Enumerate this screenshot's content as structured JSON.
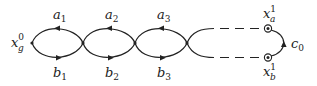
{
  "diagram": {
    "colors": {
      "stroke": "#222222",
      "background": "#ffffff"
    },
    "base_point": {
      "main": "x",
      "sub": "g",
      "sup": "0"
    },
    "loops": [
      {
        "top": {
          "main": "a",
          "sub": "1"
        },
        "bottom": {
          "main": "b",
          "sub": "1"
        }
      },
      {
        "top": {
          "main": "a",
          "sub": "2"
        },
        "bottom": {
          "main": "b",
          "sub": "2"
        }
      },
      {
        "top": {
          "main": "a",
          "sub": "3"
        },
        "bottom": {
          "main": "b",
          "sub": "3"
        }
      }
    ],
    "endpoint_top": {
      "main": "x",
      "sub": "a",
      "sup": "1"
    },
    "endpoint_bottom": {
      "main": "x",
      "sub": "b",
      "sup": "1"
    },
    "connector": {
      "main": "c",
      "sub": "0"
    },
    "arrow_directions": {
      "top_edges": "left",
      "bottom_edges": "right",
      "connector": "up"
    }
  }
}
